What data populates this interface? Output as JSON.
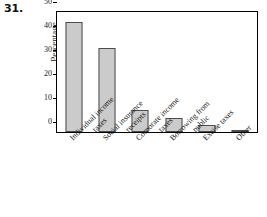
{
  "problem": {
    "number": "31."
  },
  "chart_data": {
    "type": "bar",
    "title": "",
    "xlabel": "",
    "ylabel": "Percentage",
    "ylim": [
      0,
      50
    ],
    "yticks": [
      0,
      10,
      20,
      30,
      40,
      50
    ],
    "ytick_labels": [
      "0",
      "10",
      "20",
      "30",
      "40",
      "50"
    ],
    "grid": false,
    "legend": null,
    "bar_color": "#cbcbcb",
    "bar_edge_color": "#4d4d4d",
    "axes_color": "#000000",
    "categories": [
      "Individual income taxes",
      "Social insurance receipts",
      "Corporate income taxes",
      "Borrowing from public",
      "Excise taxes",
      "Other"
    ],
    "category_lines": [
      [
        "Individual income",
        "taxes"
      ],
      [
        "Social insurance",
        "receipts"
      ],
      [
        "Corporate income",
        "taxes"
      ],
      [
        "Borrowing from",
        "public"
      ],
      [
        "Excise taxes",
        ""
      ],
      [
        "Other",
        ""
      ]
    ],
    "values": [
      46,
      35,
      9,
      6,
      3,
      1
    ]
  }
}
